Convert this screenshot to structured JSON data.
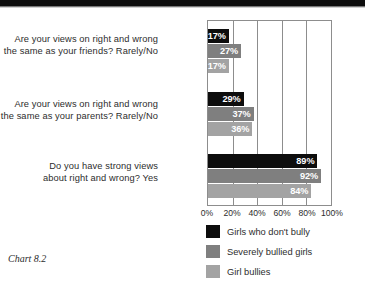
{
  "caption": "Chart 8.2",
  "chart_data": {
    "type": "bar",
    "orientation": "horizontal",
    "title": "",
    "subtitle": "",
    "xlabel": "",
    "ylabel": "",
    "xlim": [
      0,
      100
    ],
    "xticks": [
      "0%",
      "20%",
      "40%",
      "60%",
      "80%",
      "100%"
    ],
    "xtick_values": [
      0,
      20,
      40,
      60,
      80,
      100
    ],
    "grid": "vertical",
    "legend_position": "bottom",
    "categories": [
      "Are your views on right and wrong the same as your friends? Rarely/No",
      "Are your views on right and wrong the same as your parents? Rarely/No",
      "Do you have strong views about right and wrong? Yes"
    ],
    "category_lines": [
      [
        "Are your views on right and wrong",
        "the same as your friends? Rarely/No"
      ],
      [
        "Are your views on right and wrong",
        "the same as your parents? Rarely/No"
      ],
      [
        "Do you have strong views",
        "about right and wrong? Yes"
      ]
    ],
    "series": [
      {
        "name": "Girls who don't bully",
        "color": "#0d0d0d",
        "values": [
          17,
          29,
          89
        ],
        "labels": [
          "17%",
          "29%",
          "89%"
        ]
      },
      {
        "name": "Severely bullied girls",
        "color": "#7f7f7f",
        "values": [
          27,
          37,
          92
        ],
        "labels": [
          "27%",
          "37%",
          "92%"
        ]
      },
      {
        "name": "Girl bullies",
        "color": "#a3a3a3",
        "values": [
          17,
          36,
          84
        ],
        "labels": [
          "17%",
          "36%",
          "84%"
        ]
      }
    ]
  }
}
